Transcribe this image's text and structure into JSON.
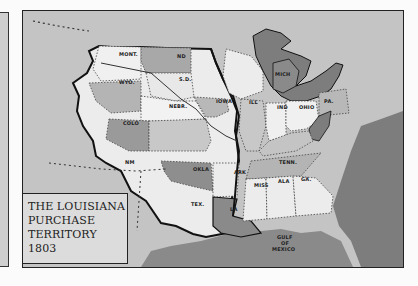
{
  "map": {
    "title_lines": [
      "THE LOUISIANA",
      "PURCHASE",
      "TERRITORY",
      "1803"
    ],
    "labels": {
      "mont": "MONT.",
      "nd": "ND",
      "sd": "S.D.",
      "wyo": "WYO.",
      "nebr": "NEBR.",
      "iowa": "IOWA",
      "colo": "COLO",
      "kans": "",
      "nm": "NM",
      "okla": "OKLA",
      "tex": "TEX.",
      "ark": "ARK",
      "la": "LA",
      "ill": "ILL",
      "mich": "MICH",
      "ind": "IND",
      "ohio": "OHIO",
      "pa": "PA.",
      "tenn": "TENN.",
      "miss": "MISS",
      "ala": "ALA",
      "ga": "GA.",
      "gulf": "GULF",
      "of": "OF",
      "mexico": "MEXICO"
    },
    "colors": {
      "background": "#c4c4c4",
      "purchase_light": "#ececec",
      "purchase_mid": "#b4b4b4",
      "purchase_dark": "#8a8a8a",
      "water_dark": "#7d7d7d",
      "east_light": "#e6e6e6",
      "border": "#111111"
    }
  }
}
